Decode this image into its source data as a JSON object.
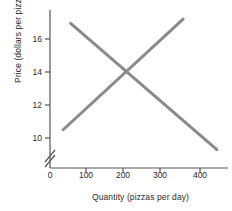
{
  "chart_data": {
    "type": "line",
    "title": "",
    "xlabel": "Quantity (pizzas per day)",
    "ylabel": "Price (dollars per pizza)",
    "xlim": [
      0,
      470
    ],
    "ylim": [
      9,
      17.6
    ],
    "grid": false,
    "legend": "none",
    "y_axis_break": true,
    "y_axis_break_symbol": "//",
    "xticks": [
      0,
      100,
      200,
      300,
      400
    ],
    "xtick_labels": [
      "0",
      "100",
      "200",
      "300",
      "400"
    ],
    "yticks": [
      10,
      12,
      14,
      16
    ],
    "ytick_labels": [
      "10",
      "12",
      "14",
      "16"
    ],
    "line_color": "#8a8a8a",
    "axis_color": "#555555",
    "background": "#ffffff",
    "series": [
      {
        "name": "demand",
        "points": [
          [
            55,
            16.95
          ],
          [
            445,
            9.3
          ]
        ]
      },
      {
        "name": "supply",
        "points": [
          [
            35,
            10.5
          ],
          [
            355,
            17.2
          ]
        ]
      }
    ],
    "equilibrium": {
      "quantity": 200,
      "price": 14
    }
  }
}
